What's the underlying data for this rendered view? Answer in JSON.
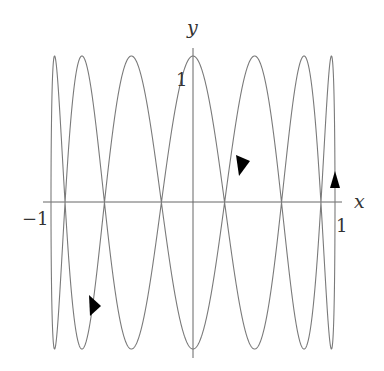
{
  "chart_data": {
    "type": "line",
    "title": "",
    "curve": {
      "name": "Lissajous curve",
      "x_expr": "sin(t)",
      "y_expr": "cos(7t)",
      "x_freq": 1,
      "y_freq": 7,
      "t_range": [
        0,
        6.283185307
      ],
      "color": "#7a7a7a"
    },
    "xlabel": "x",
    "ylabel": "y",
    "xlim": [
      -1,
      1
    ],
    "ylim": [
      -1,
      1
    ],
    "x_ticks": [
      {
        "value": -1,
        "label": "−1"
      },
      {
        "value": 1,
        "label": "1"
      }
    ],
    "y_ticks": [
      {
        "value": 1,
        "label": "1"
      }
    ],
    "grid": false,
    "legend": null,
    "direction_arrows": [
      {
        "x": 0.99,
        "y": 0.13,
        "direction": "up"
      },
      {
        "x": 0.35,
        "y": 0.27,
        "direction": "down-left"
      },
      {
        "x": -0.69,
        "y": -0.7,
        "direction": "up-left"
      }
    ],
    "top_peaks_x": [
      -0.975,
      -0.782,
      -0.434,
      0,
      0.434,
      0.782,
      0.975
    ],
    "bottom_troughs_x": [
      -0.975,
      -0.782,
      -0.434,
      0,
      0.434,
      0.782,
      0.975
    ]
  },
  "labels": {
    "x_axis": "x",
    "y_axis": "y",
    "x_min": "−1",
    "x_max": "1",
    "y_max": "1"
  },
  "colors": {
    "curve": "#7a7a7a",
    "axes": "#666666",
    "arrow": "#000000",
    "text": "#333333"
  }
}
